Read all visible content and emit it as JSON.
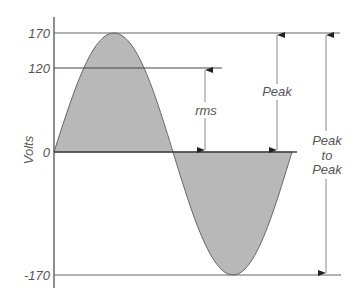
{
  "diagram": {
    "type": "sine-wave-voltage",
    "ylabel": "Volts",
    "ticks": [
      {
        "label": "170",
        "value": 170
      },
      {
        "label": "120",
        "value": 120
      },
      {
        "label": "0",
        "value": 0
      },
      {
        "label": "-170",
        "value": -170
      }
    ],
    "annotations": {
      "rms": "rms",
      "peak": "Peak",
      "peak_to_peak_line1": "Peak",
      "peak_to_peak_line2": "to",
      "peak_to_peak_line3": "Peak"
    },
    "colors": {
      "fill": "#b8b8b8",
      "line": "#666666",
      "text": "#555555"
    }
  }
}
